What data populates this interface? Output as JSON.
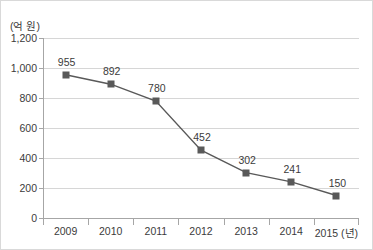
{
  "chart_data": {
    "type": "line",
    "title": "",
    "xlabel": "(년)",
    "ylabel": "(억 원)",
    "categories": [
      "2009",
      "2010",
      "2011",
      "2012",
      "2013",
      "2014",
      "2015"
    ],
    "values": [
      955,
      892,
      780,
      452,
      302,
      241,
      150
    ],
    "ylim": [
      0,
      1200
    ],
    "ytick_values": [
      0,
      200,
      400,
      600,
      800,
      1000,
      1200
    ],
    "ytick_labels": [
      "0",
      "200",
      "400",
      "600",
      "800",
      "1,000",
      "1,200"
    ],
    "xtick_labels": [
      "2009",
      "2010",
      "2011",
      "2012",
      "2013",
      "2014",
      "2015 (년)"
    ],
    "data_labels": [
      "955",
      "892",
      "780",
      "452",
      "302",
      "241",
      "150"
    ],
    "grid": true,
    "legend": "none",
    "series_color": "#595959",
    "marker": "square",
    "gridline_color": "#d6d6d6",
    "axis_color": "#a6a6a6",
    "text_color": "#3b3b3b"
  },
  "axis_unit_label": "(억 원)"
}
